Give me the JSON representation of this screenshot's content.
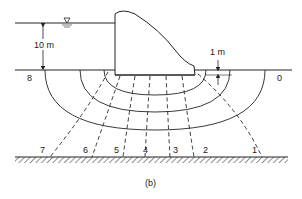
{
  "figure": {
    "caption": "(b)"
  },
  "labels": {
    "head": "10 m",
    "embedment": "1 m",
    "water_symbol": "▽"
  },
  "equipotential_labels": {
    "upstream": "8",
    "downstream": "0"
  },
  "flow_line_labels": [
    "7",
    "6",
    "5",
    "4",
    "3",
    "2",
    "1"
  ],
  "colors": {
    "line": "#222222",
    "background": "#ffffff"
  }
}
